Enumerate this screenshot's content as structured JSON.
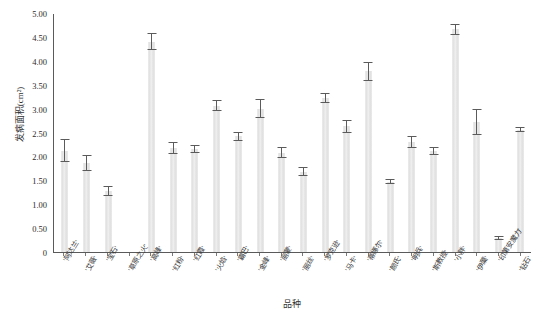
{
  "chart_data": {
    "type": "bar",
    "title": "",
    "xlabel": "品种",
    "ylabel": "发病面积(cm²)",
    "ylim": [
      0,
      5.0
    ],
    "ytick_labels": [
      "5.00",
      "4.50",
      "4.00",
      "3.50",
      "3.00",
      "2.50",
      "2.00",
      "1.50",
      "1.00",
      "0.50",
      "0"
    ],
    "ytick_values": [
      5.0,
      4.5,
      4.0,
      3.5,
      3.0,
      2.5,
      2.0,
      1.5,
      1.0,
      0.5,
      0
    ],
    "grid": false,
    "legend": null,
    "error_bars": "standard error",
    "categories": [
      "'阿达兰'",
      "'艾薇'",
      "'宝石'",
      "'草原之火'",
      "'高峰'",
      "'红粉'",
      "'红霞'",
      "'火焰'",
      "'霸巴'",
      "'金峰'",
      "'丽蒙'",
      "'丽丝'",
      "'罗克逊'",
      "'马卡'",
      "'蒂娜尔'",
      "'颜氏'",
      "'明兵'",
      "'斯教授'",
      "'小胖'",
      "'伊蕖'",
      "'印第安魔力'",
      "'钻石'"
    ],
    "values": [
      2.12,
      1.86,
      1.28,
      0.0,
      4.4,
      2.18,
      2.15,
      3.06,
      2.42,
      3.0,
      2.08,
      1.68,
      3.22,
      2.63,
      3.78,
      1.47,
      2.3,
      2.12,
      4.66,
      2.72,
      0.3,
      2.56
    ],
    "errors": [
      0.24,
      0.16,
      0.1,
      0.0,
      0.18,
      0.13,
      0.08,
      0.12,
      0.1,
      0.2,
      0.12,
      0.1,
      0.1,
      0.13,
      0.2,
      0.05,
      0.12,
      0.08,
      0.12,
      0.28,
      0.04,
      0.05
    ]
  }
}
